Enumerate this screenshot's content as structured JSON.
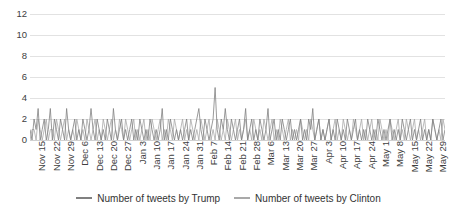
{
  "chart_data": {
    "type": "line",
    "title": "",
    "xlabel": "",
    "ylabel": "",
    "ylim": [
      0,
      12
    ],
    "yticks": [
      0,
      2,
      4,
      6,
      8,
      10,
      12
    ],
    "grid": true,
    "legend_position": "bottom",
    "x_tick_labels": [
      "Nov 15",
      "Nov 22",
      "Nov 29",
      "Dec 6",
      "Dec 13",
      "Dec 20",
      "Dec 27",
      "Jan 3",
      "Jan 10",
      "Jan 17",
      "Jan 24",
      "Jan 31",
      "Feb 7",
      "Feb 14",
      "Feb 21",
      "Feb 28",
      "Mar 6",
      "Mar 13",
      "Mar 20",
      "Mar 27",
      "Apr 3",
      "Apr 10",
      "Apr 17",
      "Apr 24",
      "May 1",
      "May 8",
      "May 15",
      "May 22",
      "May 29"
    ],
    "x_tick_interval_days": 7,
    "x_start": "Nov 15",
    "x_end": "Jun 1",
    "series": [
      {
        "name": "Number of tweets by Trump",
        "color": "#808080",
        "values": [
          1,
          0,
          2,
          1,
          3,
          0,
          1,
          2,
          0,
          1,
          3,
          0,
          2,
          1,
          0,
          2,
          1,
          0,
          3,
          1,
          0,
          1,
          2,
          0,
          1,
          0,
          2,
          1,
          0,
          1,
          3,
          1,
          0,
          2,
          1,
          0,
          1,
          0,
          2,
          1,
          0,
          3,
          1,
          0,
          1,
          2,
          0,
          1,
          0,
          1,
          2,
          0,
          1,
          0,
          2,
          1,
          0,
          1,
          0,
          2,
          1,
          0,
          1,
          0,
          1,
          3,
          0,
          1,
          0,
          2,
          1,
          0,
          1,
          0,
          1,
          0,
          1,
          2,
          0,
          1,
          0,
          1,
          2,
          3,
          1,
          0,
          2,
          1,
          0,
          1,
          2,
          5,
          1,
          0,
          2,
          1,
          3,
          1,
          0,
          2,
          1,
          0,
          1,
          2,
          0,
          1,
          3,
          0,
          1,
          2,
          0,
          1,
          0,
          2,
          1,
          0,
          1,
          3,
          0,
          1,
          2,
          0,
          1,
          0,
          2,
          1,
          0,
          1,
          2,
          0,
          1,
          0,
          1,
          2,
          0,
          1,
          0,
          2,
          1,
          3,
          0,
          1,
          2,
          0,
          1,
          0,
          1,
          2,
          0,
          1,
          0,
          2,
          1,
          0,
          1,
          0,
          2,
          1,
          0,
          1,
          2,
          0,
          1,
          0,
          1,
          0,
          2,
          1,
          0,
          1,
          0,
          2,
          1,
          0,
          1,
          0,
          1,
          2,
          0,
          1,
          0,
          1,
          0,
          2,
          1,
          0,
          1,
          2,
          0,
          1,
          0,
          1,
          2,
          0,
          1,
          0,
          1,
          0,
          2,
          1,
          0,
          1,
          2,
          0,
          1
        ]
      },
      {
        "name": "Number of tweets by Clinton",
        "color": "#a9a9a9",
        "values": [
          0,
          1,
          1,
          0,
          2,
          1,
          0,
          1,
          2,
          0,
          1,
          1,
          0,
          2,
          1,
          0,
          1,
          2,
          0,
          1,
          0,
          1,
          0,
          2,
          1,
          0,
          1,
          0,
          2,
          1,
          0,
          1,
          2,
          0,
          1,
          0,
          2,
          1,
          0,
          1,
          2,
          0,
          1,
          0,
          2,
          1,
          0,
          2,
          1,
          0,
          1,
          2,
          0,
          1,
          0,
          1,
          2,
          0,
          1,
          0,
          2,
          1,
          0,
          1,
          2,
          0,
          1,
          0,
          2,
          1,
          0,
          2,
          1,
          0,
          1,
          2,
          0,
          1,
          0,
          2,
          1,
          0,
          1,
          0,
          2,
          1,
          0,
          1,
          2,
          0,
          1,
          0,
          2,
          1,
          0,
          1,
          0,
          2,
          1,
          0,
          1,
          2,
          0,
          1,
          0,
          1,
          2,
          0,
          1,
          0,
          2,
          1,
          0,
          1,
          0,
          2,
          1,
          0,
          1,
          2,
          0,
          1,
          0,
          2,
          1,
          0,
          1,
          2,
          0,
          1,
          0,
          1,
          0,
          2,
          1,
          0,
          1,
          0,
          2,
          1,
          0,
          1,
          2,
          0,
          1,
          0,
          1,
          2,
          0,
          1,
          2,
          0,
          1,
          0,
          2,
          1,
          0,
          1,
          0,
          2,
          1,
          0,
          1,
          2,
          0,
          1,
          0,
          1,
          2,
          0,
          1,
          0,
          2,
          1,
          0,
          1,
          0,
          2,
          1,
          0,
          1,
          2,
          0,
          1,
          0,
          2,
          1,
          0,
          1,
          2,
          0,
          1,
          0,
          1,
          2,
          0,
          1,
          0,
          2,
          1,
          0,
          1,
          0,
          2,
          1
        ]
      }
    ],
    "notable_peaks": [
      {
        "label": "Feb 16",
        "value": 10,
        "series": "Number of tweets by Trump"
      },
      {
        "label": "Feb 22",
        "value": 6,
        "series": "Number of tweets by Trump"
      },
      {
        "label": "Mar 1",
        "value": 5,
        "series": "Number of tweets by Trump"
      },
      {
        "label": "Apr 17",
        "value": 6,
        "series": "Number of tweets by Trump"
      },
      {
        "label": "Jan 18",
        "value": 6,
        "series": "Number of tweets by Trump"
      }
    ]
  },
  "legend": {
    "items": [
      {
        "label": "Number of tweets by Trump",
        "color": "#808080"
      },
      {
        "label": "Number of tweets by Clinton",
        "color": "#a9a9a9"
      }
    ]
  }
}
